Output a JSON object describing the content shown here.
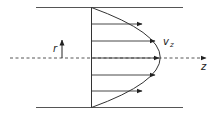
{
  "diagram": {
    "labels": {
      "radial": "r",
      "velocity_main": "v",
      "velocity_sub": "z",
      "axis": "z"
    },
    "colors": {
      "stroke": "#333333",
      "wall": "#555555",
      "background": "#ffffff"
    },
    "arrows": [
      {
        "y": 24,
        "length_fraction": 0.74
      },
      {
        "y": 41,
        "length_fraction": 0.94
      },
      {
        "y": 58,
        "length_fraction": 1.0
      },
      {
        "y": 75,
        "length_fraction": 0.94
      },
      {
        "y": 91,
        "length_fraction": 0.74
      }
    ]
  }
}
